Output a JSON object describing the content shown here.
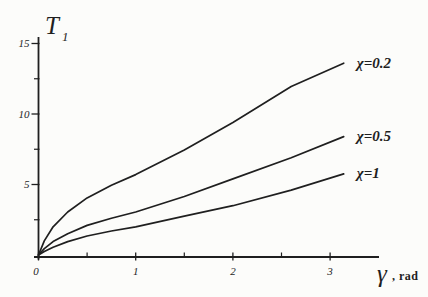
{
  "figure": {
    "background": "#fcfcfa",
    "ink": "#1f1f1f"
  },
  "chart_data": {
    "type": "line",
    "title": "",
    "xlabel": "γ, rad",
    "ylabel": "T1",
    "xlabel_main": "γ",
    "xlabel_suffix": ", rad",
    "ylabel_main": "T",
    "ylabel_sub": "1",
    "xlim": [
      0,
      3.5
    ],
    "ylim": [
      0,
      15.6
    ],
    "grid": false,
    "legend_position": "inline-right-of-curve-end",
    "x_major_ticks": [
      {
        "value": 0,
        "label": "0"
      },
      {
        "value": 1,
        "label": "1"
      },
      {
        "value": 2,
        "label": "2"
      },
      {
        "value": 3,
        "label": "3"
      }
    ],
    "x_minor_ticks": [
      0.5,
      1.5,
      2.5
    ],
    "y_major_ticks": [
      {
        "value": 5,
        "label": "5"
      },
      {
        "value": 10,
        "label": "10"
      },
      {
        "value": 15,
        "label": "15"
      }
    ],
    "y_minor_ticks": [
      2.5,
      7.5,
      12.5
    ],
    "series": [
      {
        "name": "chi-0.2",
        "label": "χ=0.2",
        "points": [
          [
            0,
            0
          ],
          [
            0.06,
            1.0
          ],
          [
            0.15,
            2.0
          ],
          [
            0.3,
            3.05
          ],
          [
            0.5,
            4.05
          ],
          [
            0.75,
            4.95
          ],
          [
            1,
            5.7
          ],
          [
            1.5,
            7.45
          ],
          [
            2,
            9.4
          ],
          [
            2.6,
            11.95
          ],
          [
            3.14,
            13.6
          ]
        ]
      },
      {
        "name": "chi-0.5",
        "label": "χ=0.5",
        "points": [
          [
            0,
            0
          ],
          [
            0.06,
            0.45
          ],
          [
            0.15,
            0.95
          ],
          [
            0.3,
            1.5
          ],
          [
            0.5,
            2.1
          ],
          [
            0.75,
            2.6
          ],
          [
            1,
            3.05
          ],
          [
            1.5,
            4.15
          ],
          [
            2,
            5.4
          ],
          [
            2.6,
            6.9
          ],
          [
            3.14,
            8.4
          ]
        ]
      },
      {
        "name": "chi-1",
        "label": "χ=1",
        "points": [
          [
            0,
            0
          ],
          [
            0.06,
            0.25
          ],
          [
            0.15,
            0.55
          ],
          [
            0.3,
            0.95
          ],
          [
            0.5,
            1.35
          ],
          [
            0.75,
            1.7
          ],
          [
            1,
            2.0
          ],
          [
            1.5,
            2.75
          ],
          [
            2,
            3.5
          ],
          [
            2.6,
            4.6
          ],
          [
            3.14,
            5.75
          ]
        ]
      }
    ]
  }
}
